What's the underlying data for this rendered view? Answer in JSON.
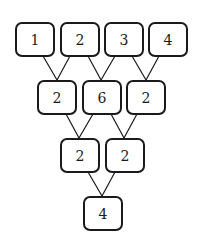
{
  "diagram": {
    "type": "number-pyramid",
    "rows": [
      {
        "nodes": [
          {
            "value": "1"
          },
          {
            "value": "2"
          },
          {
            "value": "3"
          },
          {
            "value": "4"
          }
        ]
      },
      {
        "nodes": [
          {
            "value": "2"
          },
          {
            "value": "6"
          },
          {
            "value": "2"
          }
        ]
      },
      {
        "nodes": [
          {
            "value": "2"
          },
          {
            "value": "2"
          }
        ]
      },
      {
        "nodes": [
          {
            "value": "4"
          }
        ]
      }
    ],
    "colors": {
      "stroke": "#1a1a1a",
      "background": "#ffffff"
    }
  }
}
